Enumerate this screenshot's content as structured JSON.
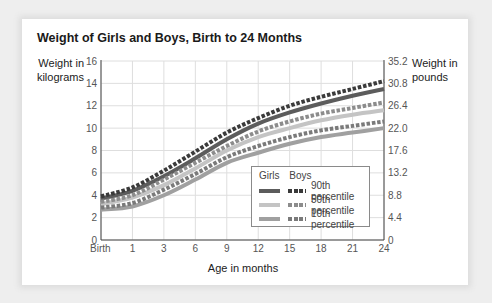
{
  "title": "Weight of Girls and Boys, Birth to 24 Months",
  "y_left_label_line1": "Weight in",
  "y_left_label_line2": "kilograms",
  "y_right_label_line1": "Weight in",
  "y_right_label_line2": "pounds",
  "x_label": "Age in months",
  "legend": {
    "header_girls": "Girls",
    "header_boys": "Boys",
    "rows": [
      {
        "label": "90th percentile",
        "girls_color": "#5c5c5c",
        "boys_color": "#3a3a3a"
      },
      {
        "label": "50th percentile",
        "girls_color": "#c4c4c4",
        "boys_color": "#8c8c8c"
      },
      {
        "label": "10th percentile",
        "girls_color": "#a0a0a0",
        "boys_color": "#7a7a7a"
      }
    ]
  },
  "chart_data": {
    "type": "line",
    "title": "Weight of Girls and Boys, Birth to 24 Months",
    "xlabel": "Age in months",
    "ylabel": "Weight in kilograms",
    "ylabel_right": "Weight in pounds",
    "categories": [
      "Birth",
      "1",
      "3",
      "6",
      "9",
      "12",
      "15",
      "18",
      "21",
      "24"
    ],
    "y_ticks_left": [
      0,
      2,
      4,
      6,
      8,
      10,
      12,
      14,
      16
    ],
    "y_ticks_right": [
      "0",
      "4.4",
      "8.8",
      "13.2",
      "17.6",
      "22.0",
      "26.4",
      "30.8",
      "35.2"
    ],
    "ylim": [
      0,
      16
    ],
    "grid": true,
    "legend_position": "lower right inside",
    "series": [
      {
        "name": "Girls 90th percentile",
        "style": "solid",
        "color": "#5c5c5c",
        "values": [
          3.7,
          4.4,
          5.7,
          7.3,
          9.0,
          10.4,
          11.4,
          12.2,
          12.9,
          13.5
        ]
      },
      {
        "name": "Boys 90th percentile",
        "style": "dashed",
        "color": "#3a3a3a",
        "values": [
          3.9,
          4.7,
          6.2,
          7.9,
          9.6,
          10.9,
          12.0,
          12.8,
          13.5,
          14.2
        ]
      },
      {
        "name": "Girls 50th percentile",
        "style": "solid",
        "color": "#c4c4c4",
        "values": [
          3.2,
          3.8,
          4.9,
          6.4,
          8.0,
          9.2,
          10.0,
          10.7,
          11.2,
          11.6
        ]
      },
      {
        "name": "Boys 50th percentile",
        "style": "dashed",
        "color": "#8c8c8c",
        "values": [
          3.4,
          4.0,
          5.4,
          6.9,
          8.4,
          9.7,
          10.6,
          11.3,
          11.8,
          12.3
        ]
      },
      {
        "name": "Girls 10th percentile",
        "style": "solid",
        "color": "#a0a0a0",
        "values": [
          2.7,
          3.0,
          4.0,
          5.4,
          6.9,
          7.8,
          8.6,
          9.2,
          9.6,
          10.0
        ]
      },
      {
        "name": "Boys 10th percentile",
        "style": "dashed",
        "color": "#7a7a7a",
        "values": [
          2.9,
          3.3,
          4.5,
          5.9,
          7.4,
          8.4,
          9.2,
          9.8,
          10.2,
          10.6
        ]
      }
    ]
  }
}
